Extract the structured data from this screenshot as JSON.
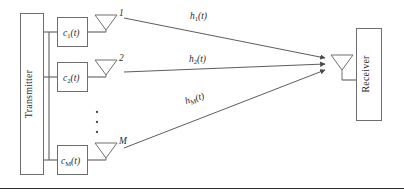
{
  "figure": {
    "type": "block-diagram",
    "topic": "multi-antenna transmitter to single-antenna receiver channel model",
    "background_color": "#ffffff",
    "line_color": "#6e6e6e",
    "text_color": "#2b2b2b"
  },
  "transmitter": {
    "label": "Transmitter",
    "orientation": "vertical-bottom-up"
  },
  "receiver": {
    "label": "Receiver",
    "orientation": "vertical-bottom-up"
  },
  "branches": [
    {
      "filter_base": "c",
      "filter_subscript": "1",
      "filter_arg": "(t)",
      "antenna_index": "1",
      "antenna_icon": "antenna-icon",
      "channel_base": "h",
      "channel_subscript": "1",
      "channel_arg": "(t)"
    },
    {
      "filter_base": "c",
      "filter_subscript": "2",
      "filter_arg": "(t)",
      "antenna_index": "2",
      "antenna_icon": "antenna-icon",
      "channel_base": "h",
      "channel_subscript": "2",
      "channel_arg": "(t)"
    },
    {
      "filter_base": "c",
      "filter_subscript": "M",
      "filter_arg": "(t)",
      "antenna_index": "M",
      "antenna_icon": "antenna-icon",
      "channel_base": "h",
      "channel_subscript": "M",
      "channel_arg": "(t)"
    }
  ],
  "ellipsis": {
    "glyph": "vertical-dots",
    "count": 3
  },
  "receiver_antenna": {
    "icon": "antenna-icon"
  }
}
